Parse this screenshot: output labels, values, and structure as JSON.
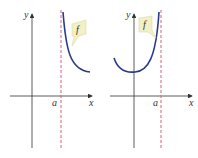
{
  "figure": {
    "panels": [
      {
        "id": "left",
        "axis_labels": {
          "x": "x",
          "y": "y"
        },
        "tick_label": "a",
        "function_label": "f",
        "description": "f(x) approaches +infinity as x approaches a from the right; vertical asymptote at x = a"
      },
      {
        "id": "right",
        "axis_labels": {
          "x": "x",
          "y": "y"
        },
        "tick_label": "a",
        "function_label": "f",
        "description": "f(x) approaches +infinity as x approaches a from the left; vertical asymptote at x = a"
      }
    ],
    "colors": {
      "curve": "#2a3a8c",
      "asymptote": "#d9607a",
      "axis": "#333333",
      "label_tag": "#f3f0c4"
    }
  }
}
